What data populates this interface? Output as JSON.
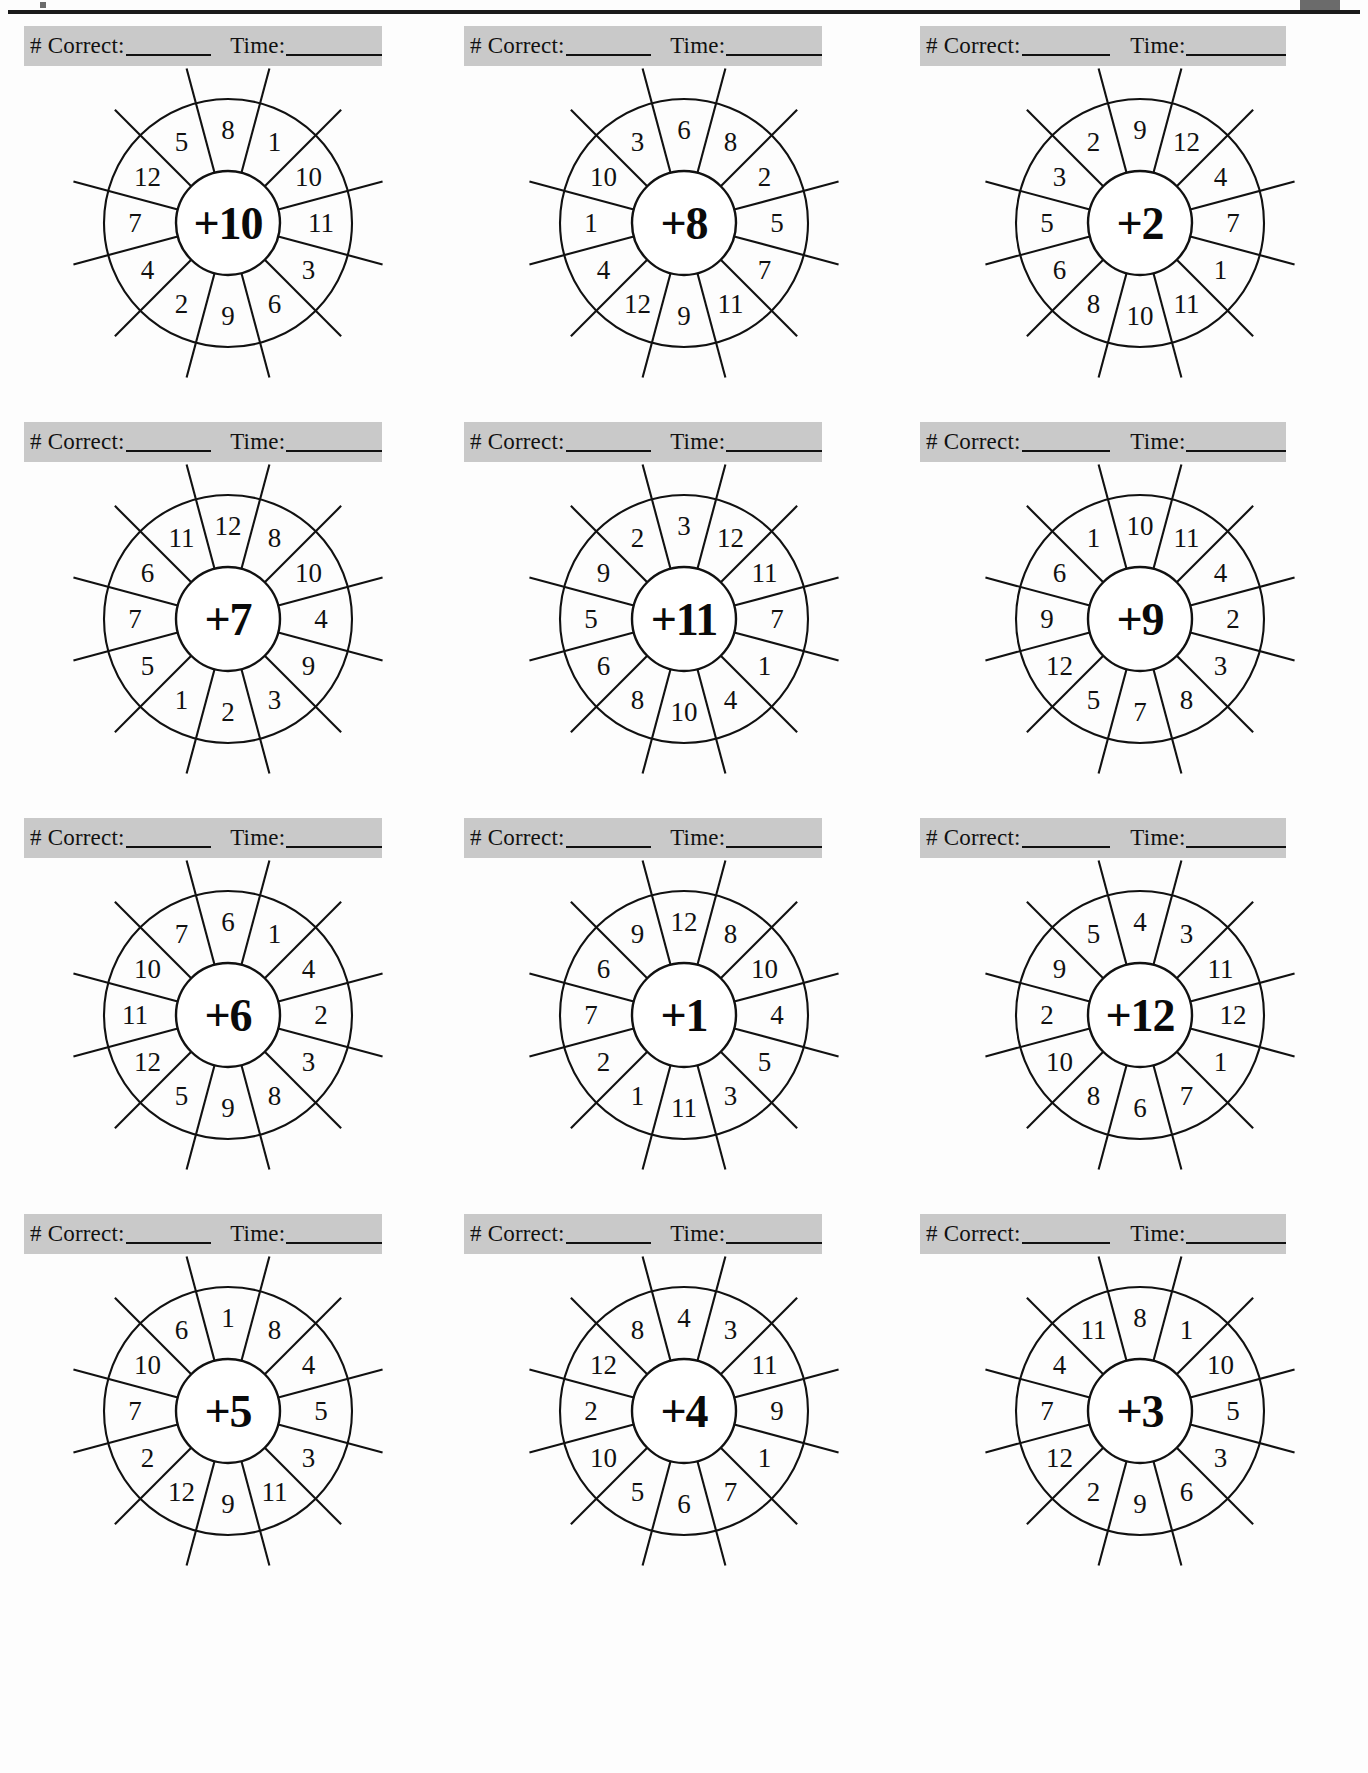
{
  "page": {
    "worksheet_type": "addition-fact-wheels",
    "bar_label_correct": "# Correct:",
    "bar_label_time": "Time:",
    "wheel_count": 12,
    "sectors_per_wheel": 12,
    "ink_color": "#111111",
    "bar_color": "#c9c9c9",
    "paper_color": "#fdfdfd"
  },
  "wheels": [
    {
      "id": "wheel-plus-10",
      "center": "+10",
      "operator": "+",
      "addend": 10,
      "row": 1,
      "col": 1,
      "numbers_clockwise_from_top": [
        8,
        1,
        10,
        11,
        3,
        6,
        9,
        2,
        4,
        7,
        12,
        5
      ]
    },
    {
      "id": "wheel-plus-8",
      "center": "+8",
      "operator": "+",
      "addend": 8,
      "row": 1,
      "col": 2,
      "numbers_clockwise_from_top": [
        6,
        8,
        2,
        5,
        7,
        11,
        9,
        12,
        4,
        1,
        10,
        3
      ]
    },
    {
      "id": "wheel-plus-2",
      "center": "+2",
      "operator": "+",
      "addend": 2,
      "row": 1,
      "col": 3,
      "numbers_clockwise_from_top": [
        9,
        12,
        4,
        7,
        1,
        11,
        10,
        8,
        6,
        5,
        3,
        2
      ]
    },
    {
      "id": "wheel-plus-7",
      "center": "+7",
      "operator": "+",
      "addend": 7,
      "row": 2,
      "col": 1,
      "numbers_clockwise_from_top": [
        12,
        8,
        10,
        4,
        9,
        3,
        2,
        1,
        5,
        7,
        6,
        11
      ]
    },
    {
      "id": "wheel-plus-11",
      "center": "+11",
      "operator": "+",
      "addend": 11,
      "row": 2,
      "col": 2,
      "numbers_clockwise_from_top": [
        3,
        12,
        11,
        7,
        1,
        4,
        10,
        8,
        6,
        5,
        9,
        2
      ]
    },
    {
      "id": "wheel-plus-9",
      "center": "+9",
      "operator": "+",
      "addend": 9,
      "row": 2,
      "col": 3,
      "numbers_clockwise_from_top": [
        10,
        11,
        4,
        2,
        3,
        8,
        7,
        5,
        12,
        9,
        6,
        1
      ]
    },
    {
      "id": "wheel-plus-6",
      "center": "+6",
      "operator": "+",
      "addend": 6,
      "row": 3,
      "col": 1,
      "numbers_clockwise_from_top": [
        6,
        1,
        4,
        2,
        3,
        8,
        9,
        5,
        12,
        11,
        10,
        7
      ]
    },
    {
      "id": "wheel-plus-1",
      "center": "+1",
      "operator": "+",
      "addend": 1,
      "row": 3,
      "col": 2,
      "numbers_clockwise_from_top": [
        12,
        8,
        10,
        4,
        5,
        3,
        11,
        1,
        2,
        7,
        6,
        9
      ]
    },
    {
      "id": "wheel-plus-12",
      "center": "+12",
      "operator": "+",
      "addend": 12,
      "row": 3,
      "col": 3,
      "numbers_clockwise_from_top": [
        4,
        3,
        11,
        12,
        1,
        7,
        6,
        8,
        10,
        2,
        9,
        5
      ]
    },
    {
      "id": "wheel-plus-5",
      "center": "+5",
      "operator": "+",
      "addend": 5,
      "row": 4,
      "col": 1,
      "numbers_clockwise_from_top": [
        1,
        8,
        4,
        5,
        3,
        11,
        9,
        12,
        2,
        7,
        10,
        6
      ]
    },
    {
      "id": "wheel-plus-4",
      "center": "+4",
      "operator": "+",
      "addend": 4,
      "row": 4,
      "col": 2,
      "numbers_clockwise_from_top": [
        4,
        3,
        11,
        9,
        1,
        7,
        6,
        5,
        10,
        2,
        12,
        8
      ]
    },
    {
      "id": "wheel-plus-3",
      "center": "+3",
      "operator": "+",
      "addend": 3,
      "row": 4,
      "col": 3,
      "numbers_clockwise_from_top": [
        8,
        1,
        10,
        5,
        3,
        6,
        9,
        2,
        12,
        7,
        4,
        11
      ]
    }
  ]
}
